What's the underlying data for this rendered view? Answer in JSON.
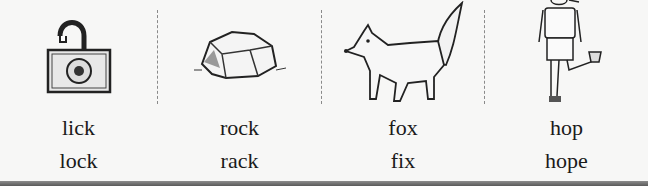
{
  "worksheet": {
    "items": [
      {
        "picture": "open-padlock",
        "word1": "lick",
        "word2": "lock"
      },
      {
        "picture": "rock",
        "word1": "rock",
        "word2": "rack"
      },
      {
        "picture": "fox",
        "word1": "fox",
        "word2": "fix"
      },
      {
        "picture": "girl-hopping",
        "word1": "hop",
        "word2": "hope"
      }
    ]
  }
}
